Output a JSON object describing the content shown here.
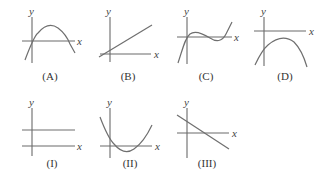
{
  "panels": [
    {
      "id": "A",
      "label": "(A)",
      "x_axis_label": "x",
      "y_axis_label": "y",
      "curve_type": "downward parabola through origin"
    },
    {
      "id": "B",
      "label": "(B)",
      "x_axis_label": "x",
      "y_axis_label": "y",
      "curve_type": "increasing line with small positive y-intercept"
    },
    {
      "id": "C",
      "label": "(C)",
      "x_axis_label": "x",
      "y_axis_label": "y",
      "curve_type": "cubic through origin"
    },
    {
      "id": "D",
      "label": "(D)",
      "x_axis_label": "x",
      "y_axis_label": "y",
      "curve_type": "downward parabola below x-axis"
    },
    {
      "id": "I",
      "label": "(I)",
      "x_axis_label": "x",
      "y_axis_label": "y",
      "curve_type": "horizontal line above x-axis"
    },
    {
      "id": "II",
      "label": "(II)",
      "x_axis_label": "x",
      "y_axis_label": "y",
      "curve_type": "upward parabola"
    },
    {
      "id": "III",
      "label": "(III)",
      "x_axis_label": "x",
      "y_axis_label": "y",
      "curve_type": "decreasing line"
    }
  ]
}
